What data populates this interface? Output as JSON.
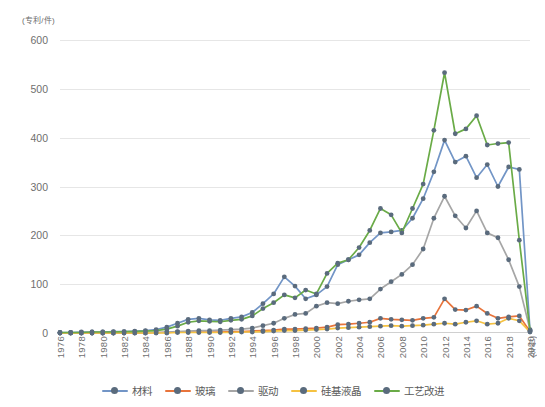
{
  "chart_data": {
    "type": "line",
    "title": "",
    "xlabel": "(年份)",
    "ylabel": "(专利/件)",
    "ylim": [
      0,
      600
    ],
    "yticks": [
      0,
      100,
      200,
      300,
      400,
      500,
      600
    ],
    "grid": true,
    "legend_position": "bottom",
    "x": [
      1976,
      1977,
      1978,
      1979,
      1980,
      1981,
      1982,
      1983,
      1984,
      1985,
      1986,
      1987,
      1988,
      1989,
      1990,
      1991,
      1992,
      1993,
      1994,
      1995,
      1996,
      1997,
      1998,
      1999,
      2000,
      2001,
      2002,
      2003,
      2004,
      2005,
      2006,
      2007,
      2008,
      2009,
      2010,
      2011,
      2012,
      2013,
      2014,
      2015,
      2016,
      2017,
      2018,
      2019,
      2020
    ],
    "xticks": [
      1976,
      1978,
      1980,
      1982,
      1984,
      1986,
      1988,
      1990,
      1992,
      1994,
      1996,
      1998,
      2000,
      2002,
      2004,
      2006,
      2008,
      2010,
      2012,
      2014,
      2016,
      2018,
      2020
    ],
    "series": [
      {
        "name": "材料",
        "color": "#7295c6",
        "values": [
          1,
          1,
          2,
          2,
          2,
          3,
          3,
          4,
          5,
          7,
          12,
          20,
          28,
          30,
          27,
          26,
          30,
          33,
          42,
          60,
          80,
          115,
          96,
          70,
          78,
          95,
          140,
          150,
          160,
          185,
          205,
          207,
          210,
          235,
          275,
          330,
          395,
          350,
          362,
          318,
          345,
          300,
          340,
          335,
          5
        ]
      },
      {
        "name": "玻璃",
        "color": "#e8743b",
        "values": [
          0,
          0,
          0,
          0,
          0,
          0,
          0,
          0,
          0,
          1,
          1,
          2,
          2,
          2,
          2,
          2,
          3,
          3,
          4,
          5,
          6,
          8,
          8,
          9,
          10,
          12,
          17,
          18,
          20,
          22,
          30,
          28,
          27,
          26,
          30,
          32,
          70,
          48,
          47,
          55,
          40,
          30,
          33,
          35,
          3
        ]
      },
      {
        "name": "驱动",
        "color": "#a6a6a6",
        "values": [
          0,
          0,
          0,
          0,
          0,
          0,
          1,
          1,
          1,
          1,
          2,
          3,
          4,
          5,
          5,
          6,
          7,
          8,
          10,
          15,
          20,
          30,
          38,
          40,
          55,
          62,
          60,
          65,
          68,
          70,
          90,
          105,
          120,
          140,
          172,
          235,
          280,
          240,
          215,
          250,
          205,
          195,
          150,
          95,
          7
        ]
      },
      {
        "name": "硅基液晶",
        "color": "#f5c242",
        "values": [
          0,
          0,
          0,
          0,
          0,
          0,
          0,
          0,
          0,
          0,
          0,
          1,
          1,
          1,
          1,
          1,
          1,
          2,
          2,
          3,
          4,
          5,
          5,
          6,
          7,
          8,
          10,
          11,
          12,
          13,
          14,
          15,
          14,
          15,
          16,
          18,
          20,
          18,
          22,
          25,
          18,
          20,
          30,
          25,
          2
        ]
      },
      {
        "name": "工艺改进",
        "color": "#6aab47",
        "values": [
          1,
          1,
          1,
          2,
          2,
          2,
          3,
          3,
          4,
          5,
          8,
          14,
          22,
          25,
          24,
          23,
          26,
          28,
          35,
          50,
          62,
          78,
          72,
          88,
          80,
          122,
          143,
          150,
          175,
          210,
          255,
          242,
          205,
          255,
          305,
          415,
          533,
          408,
          418,
          445,
          385,
          388,
          390,
          190,
          5
        ]
      }
    ]
  },
  "legend": {
    "items": [
      {
        "label": "材料",
        "color": "#7295c6"
      },
      {
        "label": "玻璃",
        "color": "#e8743b"
      },
      {
        "label": "驱动",
        "color": "#a6a6a6"
      },
      {
        "label": "硅基液晶",
        "color": "#f5c242"
      },
      {
        "label": "工艺改进",
        "color": "#6aab47"
      }
    ]
  },
  "axes": {
    "y_unit": "(专利/件)",
    "x_unit": "(年份)",
    "y_tick_labels": [
      "600",
      "500",
      "400",
      "300",
      "200",
      "100",
      "0"
    ],
    "x_tick_labels": [
      "1976",
      "1978",
      "1980",
      "1982",
      "1984",
      "1986",
      "1988",
      "1990",
      "1992",
      "1994",
      "1996",
      "1998",
      "2000",
      "2002",
      "2004",
      "2006",
      "2008",
      "2010",
      "2012",
      "2014",
      "2016",
      "2018",
      "2020"
    ]
  },
  "colors": {
    "marker": "#5a6b7d",
    "grid": "#e6e6e6",
    "text": "#6f6f6f",
    "background": "#ffffff"
  }
}
